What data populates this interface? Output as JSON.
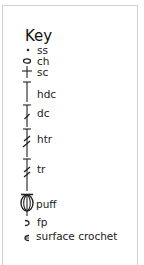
{
  "key": {
    "title": "Key",
    "items": [
      {
        "symbol": "dot-icon",
        "label": "ss"
      },
      {
        "symbol": "oval-icon",
        "label": "ch"
      },
      {
        "symbol": "plus-icon",
        "label": "sc"
      },
      {
        "symbol": "t-bar-icon",
        "label": "hdc"
      },
      {
        "symbol": "t-bar-one-slash-icon",
        "label": "dc"
      },
      {
        "symbol": "t-bar-two-slash-icon",
        "label": "htr"
      },
      {
        "symbol": "t-bar-two-slash-long-icon",
        "label": "tr"
      },
      {
        "symbol": "puff-icon",
        "label": "puff"
      },
      {
        "symbol": "front-post-icon",
        "label": "fp"
      },
      {
        "symbol": "surface-crochet-icon",
        "label": "surface crochet"
      }
    ]
  }
}
